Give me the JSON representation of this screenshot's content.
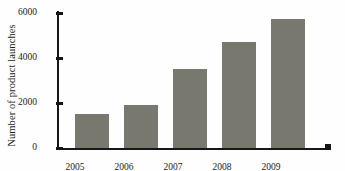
{
  "chart_data": {
    "type": "bar",
    "title": "",
    "xlabel": "",
    "ylabel": "Number of product launches",
    "categories": [
      "2005",
      "2006",
      "2007",
      "2008",
      "2009"
    ],
    "values": [
      1500,
      1900,
      3500,
      4700,
      5750
    ],
    "ylim": [
      0,
      6000
    ],
    "yticks": [
      "0",
      "2000",
      "4000",
      "6000"
    ],
    "ytick_values": [
      0,
      2000,
      4000,
      6000
    ],
    "grid": false,
    "legend": null,
    "bar_color": "#78786f",
    "axis_color": "#161616",
    "background_color": "#fefefe"
  }
}
